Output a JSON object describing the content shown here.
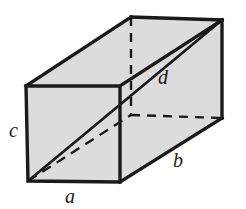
{
  "figure": {
    "name": "rectangular-box-space-diagonal",
    "type": "geometry-diagram",
    "colors": {
      "face_fill": "#dcdcdc",
      "edge_stroke": "#1a1a1a",
      "hidden_stroke": "#1a1a1a",
      "label_color": "#1a1a1a",
      "background": "#ffffff"
    },
    "stroke_widths": {
      "visible_edge": 3.4,
      "diagonal": 2.6,
      "hidden_edge": 2.4
    },
    "hidden_dash_pattern": "9 7",
    "labels": [
      {
        "id": "a",
        "text": "a",
        "x": 70,
        "y": 203,
        "edge": "front-bottom-width"
      },
      {
        "id": "b",
        "text": "b",
        "x": 178,
        "y": 167,
        "edge": "bottom-right-depth"
      },
      {
        "id": "c",
        "text": "c",
        "x": 9,
        "y": 137,
        "edge": "front-left-height"
      },
      {
        "id": "d",
        "text": "d",
        "x": 163,
        "y": 84,
        "edge": "space-diagonal"
      }
    ],
    "vertices": {
      "front_top_left": [
        26,
        86
      ],
      "front_top_right": [
        120,
        86
      ],
      "front_bottom_left": [
        28,
        181
      ],
      "front_bottom_right": [
        120,
        182
      ],
      "back_top_left": [
        131,
        17
      ],
      "back_top_right": [
        222,
        20
      ],
      "back_bottom_left": [
        131,
        115
      ],
      "back_bottom_right": [
        222,
        118
      ]
    },
    "edges": {
      "visible": [
        "front_top_left-front_top_right",
        "front_top_right-front_bottom_right",
        "front_bottom_right-front_bottom_left",
        "front_bottom_left-front_top_left",
        "front_top_left-back_top_left",
        "front_top_right-back_top_right",
        "back_top_left-back_top_right",
        "back_top_right-back_bottom_right",
        "back_bottom_right-front_bottom_right"
      ],
      "hidden": [
        "back_top_left-back_bottom_left",
        "back_bottom_left-back_bottom_right"
      ]
    },
    "diagonals": {
      "space_diagonal_solid": {
        "from": [
          28,
          181
        ],
        "to": [
          222,
          20
        ],
        "label": "d",
        "style": "solid"
      },
      "base_diagonal_hidden": {
        "from": [
          28,
          181
        ],
        "to": [
          131,
          115
        ],
        "label": "",
        "style": "dashed"
      },
      "far_face_diagonal_solid": {
        "from": [
          120,
          86
        ],
        "to": [
          222,
          20
        ],
        "style": "solid"
      }
    }
  }
}
